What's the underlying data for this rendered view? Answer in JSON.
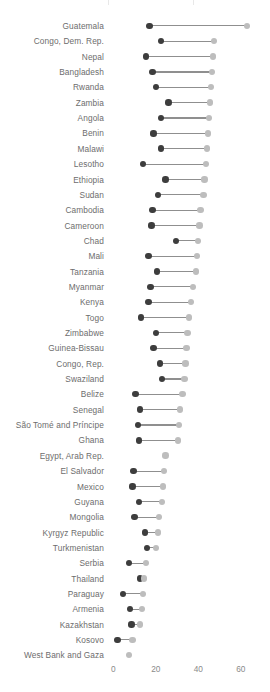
{
  "chart_data": {
    "type": "dumbbell",
    "title": "",
    "subtitle": "",
    "xlabel": "",
    "ylabel": "",
    "xlim": [
      -2,
      68
    ],
    "xticks": [
      0,
      20,
      40,
      60
    ],
    "xtick_labels": [
      "0",
      "20",
      "40",
      "60"
    ],
    "grid": false,
    "legend": null,
    "series": [
      {
        "name": "start",
        "color": "#3d3d3d"
      },
      {
        "name": "end",
        "color": "#bdbdbd"
      }
    ],
    "categories": [
      "Guatemala",
      "Congo, Dem. Rep.",
      "Nepal",
      "Bangladesh",
      "Rwanda",
      "Zambia",
      "Angola",
      "Benin",
      "Malawi",
      "Lesotho",
      "Ethiopia",
      "Sudan",
      "Cambodia",
      "Cameroon",
      "Chad",
      "Mali",
      "Tanzania",
      "Myanmar",
      "Kenya",
      "Togo",
      "Zimbabwe",
      "Guinea-Bissau",
      "Congo, Rep.",
      "Swaziland",
      "Belize",
      "Senegal",
      "São Tomé and Príncipe",
      "Ghana",
      "Egypt, Arab Rep.",
      "El Salvador",
      "Mexico",
      "Guyana",
      "Mongolia",
      "Kyrgyz Republic",
      "Turkmenistan",
      "Serbia",
      "Thailand",
      "Paraguay",
      "Armenia",
      "Kazakhstan",
      "Kosovo",
      "West Bank and Gaza"
    ],
    "points": [
      {
        "category": "Guatemala",
        "start": 17.0,
        "end": 63.0
      },
      {
        "category": "Congo, Dem. Rep.",
        "start": 22.5,
        "end": 47.5
      },
      {
        "category": "Nepal",
        "start": 15.5,
        "end": 47.0
      },
      {
        "category": "Bangladesh",
        "start": 18.5,
        "end": 46.5
      },
      {
        "category": "Rwanda",
        "start": 20.0,
        "end": 46.0
      },
      {
        "category": "Zambia",
        "start": 26.0,
        "end": 45.5
      },
      {
        "category": "Angola",
        "start": 22.5,
        "end": 45.0
      },
      {
        "category": "Benin",
        "start": 19.0,
        "end": 44.5
      },
      {
        "category": "Malawi",
        "start": 22.5,
        "end": 44.0
      },
      {
        "category": "Lesotho",
        "start": 14.0,
        "end": 43.5
      },
      {
        "category": "Ethiopia",
        "start": 24.5,
        "end": 43.0
      },
      {
        "category": "Sudan",
        "start": 21.0,
        "end": 42.5
      },
      {
        "category": "Cambodia",
        "start": 18.5,
        "end": 41.0
      },
      {
        "category": "Cameroon",
        "start": 18.0,
        "end": 40.5
      },
      {
        "category": "Chad",
        "start": 29.5,
        "end": 40.0
      },
      {
        "category": "Mali",
        "start": 16.5,
        "end": 39.5
      },
      {
        "category": "Tanzania",
        "start": 20.5,
        "end": 39.0
      },
      {
        "category": "Myanmar",
        "start": 17.5,
        "end": 37.5
      },
      {
        "category": "Kenya",
        "start": 16.5,
        "end": 36.5
      },
      {
        "category": "Togo",
        "start": 13.0,
        "end": 35.5
      },
      {
        "category": "Zimbabwe",
        "start": 20.0,
        "end": 35.0
      },
      {
        "category": "Guinea-Bissau",
        "start": 19.0,
        "end": 34.5
      },
      {
        "category": "Congo, Rep.",
        "start": 22.0,
        "end": 34.0
      },
      {
        "category": "Swaziland",
        "start": 23.0,
        "end": 33.5
      },
      {
        "category": "Belize",
        "start": 10.5,
        "end": 32.5
      },
      {
        "category": "Senegal",
        "start": 12.5,
        "end": 31.5
      },
      {
        "category": "São Tomé and Príncipe",
        "start": 11.5,
        "end": 31.0
      },
      {
        "category": "Ghana",
        "start": 12.0,
        "end": 30.5
      },
      {
        "category": "Egypt, Arab Rep.",
        "start": 24.5,
        "end": 24.5
      },
      {
        "category": "El Salvador",
        "start": 9.5,
        "end": 24.0
      },
      {
        "category": "Mexico",
        "start": 9.0,
        "end": 23.5
      },
      {
        "category": "Guyana",
        "start": 12.0,
        "end": 23.0
      },
      {
        "category": "Mongolia",
        "start": 10.0,
        "end": 21.5
      },
      {
        "category": "Kyrgyz Republic",
        "start": 15.0,
        "end": 21.0
      },
      {
        "category": "Turkmenistan",
        "start": 16.0,
        "end": 20.0
      },
      {
        "category": "Serbia",
        "start": 7.5,
        "end": 15.5
      },
      {
        "category": "Thailand",
        "start": 12.5,
        "end": 14.5
      },
      {
        "category": "Paraguay",
        "start": 4.5,
        "end": 14.0
      },
      {
        "category": "Armenia",
        "start": 8.0,
        "end": 13.5
      },
      {
        "category": "Kazakhstan",
        "start": 8.5,
        "end": 12.5
      },
      {
        "category": "Kosovo",
        "start": 2.0,
        "end": 9.0
      },
      {
        "category": "West Bank and Gaza",
        "start": 7.5,
        "end": 7.5
      }
    ]
  },
  "colors": {
    "dot_start": "#3d3d3d",
    "dot_end": "#bdbdbd",
    "connector": "#8f8f8f",
    "label_text": "#6d6d6d",
    "tick_text": "#8a8a8a",
    "background": "#ffffff"
  }
}
